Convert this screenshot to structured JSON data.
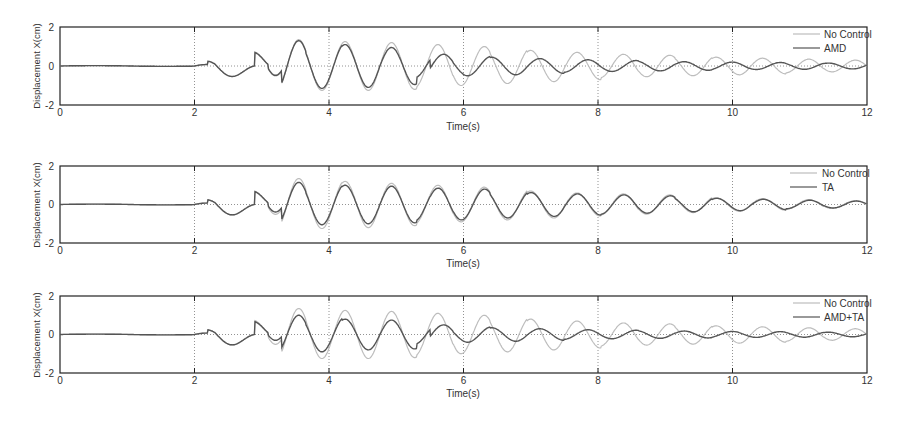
{
  "chart_data": [
    {
      "type": "line",
      "title": "",
      "xlabel": "Time(s)",
      "ylabel": "Displacement X(cm)",
      "xlim": [
        0,
        12
      ],
      "ylim": [
        -2,
        2
      ],
      "xticks": [
        "0",
        "2",
        "4",
        "6",
        "8",
        "10",
        "12"
      ],
      "yticks": [
        "2",
        "0",
        "-2"
      ],
      "grid": "dotted at x=2,4,6,8,10 and y=0",
      "legend_position": "upper right",
      "series": [
        {
          "name": "No Control",
          "color": "#bdbdbd",
          "amp": [
            0,
            0.25,
            0.75,
            1.35,
            1.25,
            1.25,
            1.2,
            1.1,
            1.0,
            0.9,
            0.8,
            0.7,
            0.6,
            0.55,
            0.5,
            0.45,
            0.4,
            0.35,
            0.3
          ],
          "phase": 0
        },
        {
          "name": "AMD",
          "color": "#555555",
          "amp": [
            0,
            0.25,
            0.7,
            1.3,
            1.15,
            1.1,
            0.95,
            0.6,
            0.5,
            0.45,
            0.38,
            0.32,
            0.28,
            0.25,
            0.22,
            0.2,
            0.18,
            0.17,
            0.15
          ],
          "phase": 1
        }
      ]
    },
    {
      "type": "line",
      "title": "",
      "xlabel": "Time(s)",
      "ylabel": "Displacement X(cm)",
      "xlim": [
        0,
        12
      ],
      "ylim": [
        -2,
        2
      ],
      "xticks": [
        "0",
        "2",
        "4",
        "6",
        "8",
        "10",
        "12"
      ],
      "yticks": [
        "2",
        "0",
        "-2"
      ],
      "grid": "dotted at x=2,4,6,8,10 and y=0",
      "legend_position": "upper right",
      "series": [
        {
          "name": "No Control",
          "color": "#bdbdbd",
          "amp": [
            0,
            0.25,
            0.7,
            1.35,
            1.25,
            1.2,
            1.1,
            1.0,
            0.9,
            0.8,
            0.7,
            0.6,
            0.55,
            0.5,
            0.42,
            0.35,
            0.3,
            0.25,
            0.2
          ],
          "phase": 0
        },
        {
          "name": "TA",
          "color": "#555555",
          "amp": [
            0,
            0.25,
            0.65,
            1.15,
            1.05,
            1.0,
            0.95,
            0.85,
            0.8,
            0.7,
            0.62,
            0.55,
            0.5,
            0.45,
            0.38,
            0.32,
            0.27,
            0.22,
            0.18
          ],
          "phase": 0.05
        }
      ]
    },
    {
      "type": "line",
      "title": "",
      "xlabel": "Time(s)",
      "ylabel": "Displacement X(cm)",
      "xlim": [
        0,
        12
      ],
      "ylim": [
        -2,
        2
      ],
      "xticks": [
        "0",
        "2",
        "4",
        "6",
        "8",
        "10",
        "12"
      ],
      "yticks": [
        "2",
        "0",
        "-2"
      ],
      "grid": "dotted at x=2,4,6,8,10 and y=0",
      "legend_position": "upper right",
      "series": [
        {
          "name": "No Control",
          "color": "#bdbdbd",
          "amp": [
            0,
            0.25,
            0.75,
            1.35,
            1.25,
            1.25,
            1.2,
            1.1,
            1.0,
            0.9,
            0.8,
            0.7,
            0.6,
            0.55,
            0.5,
            0.45,
            0.4,
            0.35,
            0.3
          ],
          "phase": 0
        },
        {
          "name": "AMD+TA",
          "color": "#555555",
          "amp": [
            0,
            0.25,
            0.65,
            1.0,
            0.9,
            0.8,
            0.75,
            0.5,
            0.4,
            0.35,
            0.3,
            0.25,
            0.22,
            0.2,
            0.18,
            0.16,
            0.15,
            0.14,
            0.12
          ],
          "phase": 1
        }
      ]
    }
  ],
  "panels": [
    {
      "legend": [
        "No Control",
        "AMD"
      ],
      "xlabel": "Time(s)",
      "ylabel": "Displacement X(cm)"
    },
    {
      "legend": [
        "No Control",
        "TA"
      ],
      "xlabel": "Time(s)",
      "ylabel": "Displacement X(cm)"
    },
    {
      "legend": [
        "No Control",
        "AMD+TA"
      ],
      "xlabel": "Time(s)",
      "ylabel": "Displacement X(cm)"
    }
  ]
}
